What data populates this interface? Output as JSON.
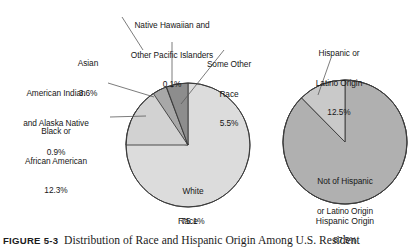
{
  "figure": {
    "number": "FIGURE 5-3",
    "caption": "Distribution of Race and Hispanic Origin Among U.S. Resident"
  },
  "chart_data": [
    {
      "type": "pie",
      "title": "Race",
      "xlabel": "",
      "ylabel": "",
      "start_angle_deg": 0,
      "direction": "counterclockwise",
      "categories": [
        "Some Other Race",
        "Native Hawaiian and Other Pacific Islanders",
        "Asian",
        "American Indian and Alaska Native",
        "Black or African American",
        "White"
      ],
      "values": [
        5.5,
        0.1,
        3.6,
        0.9,
        12.3,
        75.1
      ],
      "unit": "%",
      "slices": [
        {
          "label": "Some Other Race",
          "label_lines": [
            "Some Other",
            "Race"
          ],
          "value": 5.5,
          "value_text": "5.5%",
          "color": "#8d8d8d"
        },
        {
          "label": "Native Hawaiian and Other Pacific Islanders",
          "label_lines": [
            "Native Hawaiian and",
            "Other Pacific Islanders"
          ],
          "value": 0.1,
          "value_text": "0.1%",
          "color": "#6e6e6e"
        },
        {
          "label": "Asian",
          "label_lines": [
            "Asian"
          ],
          "value": 3.6,
          "value_text": "3.6%",
          "color": "#a8a8a8"
        },
        {
          "label": "American Indian and Alaska Native",
          "label_lines": [
            "American Indian",
            "and Alaska Native"
          ],
          "value": 0.9,
          "value_text": "0.9%",
          "color": "#c6c6c6"
        },
        {
          "label": "Black or African American",
          "label_lines": [
            "Black or",
            "African American"
          ],
          "value": 12.3,
          "value_text": "12.3%",
          "color": "#d2d2d2"
        },
        {
          "label": "White",
          "label_lines": [
            "White"
          ],
          "value": 75.1,
          "value_text": "75.1%",
          "color": "#dcdcdc"
        }
      ]
    },
    {
      "type": "pie",
      "title": "Hispanic Origin",
      "xlabel": "",
      "ylabel": "",
      "start_angle_deg": 0,
      "direction": "counterclockwise",
      "categories": [
        "Hispanic or Latino Origin",
        "Not of Hispanic or Latino Origin"
      ],
      "values": [
        12.5,
        87.5
      ],
      "unit": "%",
      "slices": [
        {
          "label": "Hispanic or Latino Origin",
          "label_lines": [
            "Hispanic or",
            "Latino Origin"
          ],
          "value": 12.5,
          "value_text": "12.5%",
          "color": "#c9c9c9"
        },
        {
          "label": "Not of Hispanic or Latino Origin",
          "label_lines": [
            "Not of Hispanic",
            "or Latino Origin"
          ],
          "value": 87.5,
          "value_text": "87.5%",
          "color": "#b0b0b0"
        }
      ]
    }
  ],
  "labels": {
    "native_hawaiian_l1": "Native Hawaiian and",
    "native_hawaiian_l2": "Other Pacific Islanders",
    "native_hawaiian_pct": "0.1%",
    "asian_l1": "Asian",
    "asian_pct": "3.6%",
    "amerindian_l1": "American Indian",
    "amerindian_l2": "and Alaska Native",
    "amerindian_pct": "0.9%",
    "black_l1": "Black or",
    "black_l2": "African American",
    "black_pct": "12.3%",
    "some_other_l1": "Some Other",
    "some_other_l2": "Race",
    "some_other_pct": "5.5%",
    "white_l1": "White",
    "white_pct": "75.1%",
    "hispanic_l1": "Hispanic or",
    "hispanic_l2": "Latino Origin",
    "hispanic_pct": "12.5%",
    "not_hispanic_l1": "Not of Hispanic",
    "not_hispanic_l2": "or Latino Origin",
    "not_hispanic_pct": "87.5%",
    "race_axis": "Race",
    "hispanic_axis": "Hispanic Origin"
  },
  "colors": {
    "outline": "#3a3a3a",
    "leader": "#5a5a5a",
    "text": "#161616"
  }
}
